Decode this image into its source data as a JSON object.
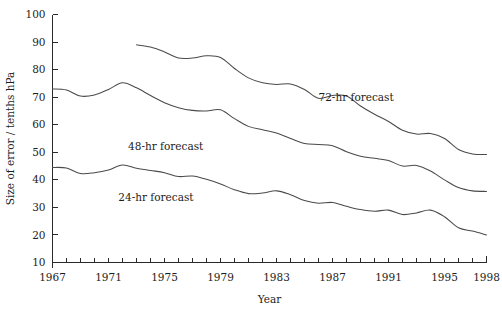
{
  "chart_data": {
    "type": "line",
    "title": "",
    "xlabel": "Year",
    "ylabel": "Size of error / tenths hPa",
    "xlim": [
      1967,
      1998
    ],
    "ylim": [
      10,
      100
    ],
    "grid": false,
    "legend_position": "inline-annotations",
    "y_ticks": [
      10,
      20,
      30,
      40,
      50,
      60,
      70,
      80,
      90,
      100
    ],
    "y_tick_labels": [
      "10",
      "20",
      "30",
      "40",
      "50",
      "60",
      "70",
      "80",
      "90",
      "100"
    ],
    "x_ticks": [
      1967,
      1968,
      1969,
      1970,
      1971,
      1972,
      1973,
      1974,
      1975,
      1976,
      1977,
      1978,
      1979,
      1980,
      1981,
      1982,
      1983,
      1984,
      1985,
      1986,
      1987,
      1988,
      1989,
      1990,
      1991,
      1992,
      1993,
      1994,
      1995,
      1996,
      1997,
      1998
    ],
    "x_tick_labels": [
      {
        "x": 1967,
        "label": "1967"
      },
      {
        "x": 1971,
        "label": "1971"
      },
      {
        "x": 1975,
        "label": "1975"
      },
      {
        "x": 1979,
        "label": "1979"
      },
      {
        "x": 1983,
        "label": "1983"
      },
      {
        "x": 1987,
        "label": "1987"
      },
      {
        "x": 1991,
        "label": "1991"
      },
      {
        "x": 1995,
        "label": "1995"
      },
      {
        "x": 1998,
        "label": "1998"
      }
    ],
    "series": [
      {
        "name": "24-hr forecast",
        "label": "24-hr forecast",
        "color": "#4a4a4a",
        "x": [
          1967,
          1968,
          1969,
          1970,
          1971,
          1972,
          1973,
          1974,
          1975,
          1976,
          1977,
          1978,
          1979,
          1980,
          1981,
          1982,
          1983,
          1984,
          1985,
          1986,
          1987,
          1988,
          1989,
          1990,
          1991,
          1992,
          1993,
          1994,
          1995,
          1996,
          1997,
          1998
        ],
        "values": [
          44.5,
          44.3,
          42.3,
          42.6,
          43.6,
          45.4,
          44.2,
          43.4,
          42.6,
          41.2,
          41.4,
          40.2,
          38.5,
          36.4,
          35.0,
          35.2,
          36.0,
          34.6,
          32.5,
          31.5,
          31.8,
          30.4,
          29.2,
          28.6,
          29.0,
          27.4,
          28.0,
          29.0,
          26.6,
          22.6,
          21.4,
          20.0
        ]
      },
      {
        "name": "48-hr forecast",
        "label": "48-hr forecast",
        "color": "#4a4a4a",
        "x": [
          1967,
          1968,
          1969,
          1970,
          1971,
          1972,
          1973,
          1974,
          1975,
          1976,
          1977,
          1978,
          1979,
          1980,
          1981,
          1982,
          1983,
          1984,
          1985,
          1986,
          1987,
          1988,
          1989,
          1990,
          1991,
          1992,
          1993,
          1994,
          1995,
          1996,
          1997,
          1998
        ],
        "values": [
          73.0,
          72.6,
          70.4,
          70.8,
          72.8,
          75.2,
          73.4,
          70.6,
          68.0,
          66.2,
          65.2,
          65.0,
          65.4,
          62.2,
          59.4,
          58.2,
          57.0,
          55.0,
          53.2,
          52.8,
          52.4,
          50.2,
          48.6,
          47.8,
          47.0,
          45.0,
          45.2,
          43.2,
          40.0,
          37.2,
          36.0,
          35.8
        ]
      },
      {
        "name": "72-hr forecast",
        "label": "72-hr forecast",
        "color": "#4a4a4a",
        "x": [
          1973,
          1974,
          1975,
          1976,
          1977,
          1978,
          1979,
          1980,
          1981,
          1982,
          1983,
          1984,
          1985,
          1986,
          1987,
          1988,
          1989,
          1990,
          1991,
          1992,
          1993,
          1994,
          1995,
          1996,
          1997,
          1998
        ],
        "values": [
          89.0,
          88.2,
          86.4,
          84.2,
          84.2,
          85.0,
          84.4,
          80.4,
          77.0,
          75.2,
          74.6,
          74.8,
          72.8,
          69.6,
          70.6,
          70.4,
          66.8,
          63.8,
          61.2,
          58.0,
          56.6,
          56.8,
          55.0,
          51.0,
          49.4,
          49.2
        ]
      }
    ],
    "annotations": [
      {
        "name": "label-72hr",
        "text": "72-hr forecast",
        "x": 1986.0,
        "y": 68.5
      },
      {
        "name": "label-48hr",
        "text": "48-hr forecast",
        "x": 1972.4,
        "y": 51.0
      },
      {
        "name": "label-24hr",
        "text": "24-hr forecast",
        "x": 1971.7,
        "y": 32.2
      }
    ]
  }
}
